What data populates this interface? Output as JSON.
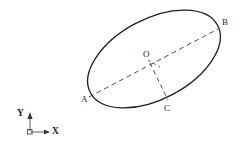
{
  "figure": {
    "background_color": "#ffffff",
    "stroke_color": "#1d1d1d",
    "dash_color": "#3a3a3a",
    "width": 239,
    "height": 151
  },
  "ellipse": {
    "center_x": 154,
    "center_y": 59,
    "semi_major": 72,
    "semi_minor": 40,
    "rotation_deg": -28,
    "stroke_width": 1.3
  },
  "points": {
    "A": {
      "label": "A",
      "x": 90,
      "y": 97
    },
    "B": {
      "label": "B",
      "x": 217,
      "y": 29
    },
    "C": {
      "label": "C",
      "x": 167,
      "y": 101
    },
    "O": {
      "label": "O",
      "x": 148,
      "y": 62
    }
  },
  "segments": [
    {
      "name": "major-axis-A-to-B",
      "from": "A",
      "to": "B",
      "style": "dashed"
    },
    {
      "name": "radius-O-to-C",
      "from": "O",
      "to": "C",
      "style": "dashed"
    },
    {
      "name": "tick-from-O",
      "from": "O",
      "to": "elbow",
      "style": "dashed"
    }
  ],
  "axes": {
    "origin_x": 30,
    "origin_y": 132,
    "x_label": "X",
    "y_label": "Y",
    "x_tip_x": 50,
    "y_tip_y": 112,
    "origin_marker": "square"
  }
}
